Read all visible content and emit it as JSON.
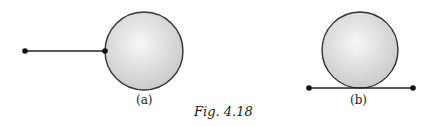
{
  "figure": {
    "caption": "Fig. 4.18",
    "colors": {
      "stroke": "#222222",
      "sphere_light": "#f6f6f6",
      "sphere_dark": "#c8c8c8"
    },
    "panels": [
      {
        "label": "(a)",
        "description": "sphere attached to a string from a point on its left side"
      },
      {
        "label": "(b)",
        "description": "sphere resting on a horizontal string between two points"
      }
    ]
  }
}
